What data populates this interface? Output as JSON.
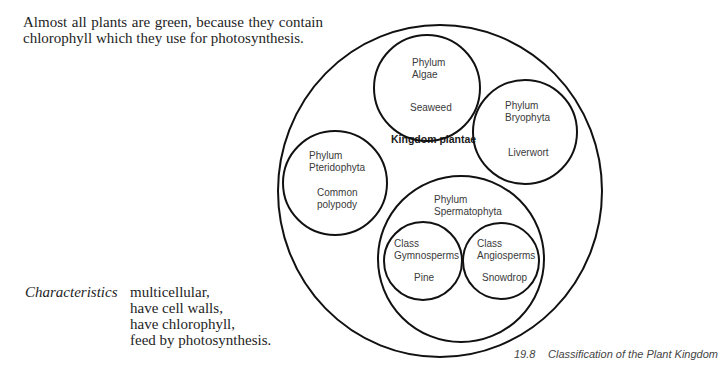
{
  "intro": {
    "line1": "Almost all plants are green, because they contain",
    "line2": "chlorophyll which they use for photosynthesis."
  },
  "characteristics": {
    "label": "Characteristics",
    "items": [
      "multicellular,",
      "have cell walls,",
      "have chlorophyll,",
      "feed by photosynthesis."
    ]
  },
  "diagram": {
    "kingdom": {
      "label": "Kingdom plantae"
    },
    "algae": {
      "rank": "Phylum",
      "name": "Algae",
      "example": "Seaweed"
    },
    "bryophyta": {
      "rank": "Phylum",
      "name": "Bryophyta",
      "example": "Liverwort"
    },
    "pteridophyta": {
      "rank": "Phylum",
      "name": "Pteridophyta",
      "example_line1": "Common",
      "example_line2": "polypody"
    },
    "spermatophyta": {
      "rank": "Phylum",
      "name": "Spermatophyta"
    },
    "gymnosperms": {
      "rank": "Class",
      "name": "Gymnosperms",
      "example": "Pine"
    },
    "angiosperms": {
      "rank": "Class",
      "name": "Angiosperms",
      "example": "Snowdrop"
    }
  },
  "caption": {
    "number": "19.8",
    "text": "Classification of the Plant Kingdom"
  },
  "colors": {
    "stroke": "#111111",
    "body_text": "#1e1e1e",
    "label_text": "#3a3a3a"
  }
}
